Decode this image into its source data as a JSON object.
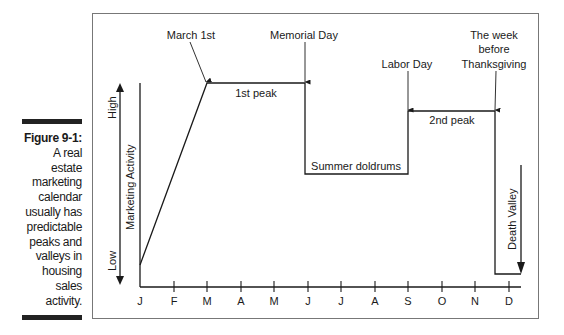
{
  "caption": {
    "title": "Figure 9-1:",
    "body_lines": [
      "A real",
      "estate",
      "marketing",
      "calendar",
      "usually has",
      "predictable",
      "peaks and",
      "valleys in",
      "housing",
      "sales",
      "activity."
    ]
  },
  "diagram": {
    "y_axis": {
      "label": "Marketing Activity",
      "high": "High",
      "low": "Low"
    },
    "x_axis": {
      "months": [
        "J",
        "F",
        "M",
        "A",
        "M",
        "J",
        "J",
        "A",
        "S",
        "O",
        "N",
        "D"
      ]
    },
    "annotations": {
      "march_1st": "March 1st",
      "memorial_day": "Memorial Day",
      "labor_day": "Labor Day",
      "thanksgiving_line1": "The week",
      "thanksgiving_line2": "before",
      "thanksgiving_line3": "Thanksgiving"
    },
    "segments": {
      "first_peak": "1st peak",
      "summer_doldrums": "Summer doldrums",
      "second_peak": "2nd peak",
      "death_valley": "Death Valley"
    }
  },
  "colors": {
    "line": "#1a1a1a",
    "frame": "#777777",
    "bar": "#222222"
  }
}
